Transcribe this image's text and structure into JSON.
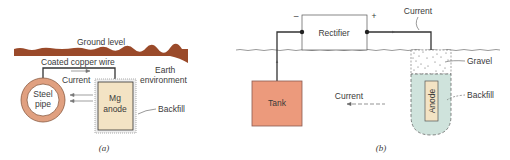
{
  "figure_a": {
    "caption": "(a)",
    "labels": {
      "ground_level": "Ground level",
      "wire": "Coated copper wire",
      "current": "Current",
      "earth_line1": "Earth",
      "earth_line2": "environment",
      "pipe_line1": "Steel",
      "pipe_line2": "pipe",
      "anode_line1": "Mg",
      "anode_line2": "anode",
      "backfill": "Backfill"
    }
  },
  "figure_b": {
    "caption": "(b)",
    "labels": {
      "rectifier": "Rectifier",
      "minus": "–",
      "plus": "+",
      "current_top": "Current",
      "gravel": "Gravel",
      "tank": "Tank",
      "current_ground": "Current",
      "anode": "Anode",
      "backfill": "Backfill"
    }
  },
  "colors": {
    "ground": "#9a4a2a",
    "pipe_ring": "#e0a080",
    "anode_fill": "#f3e3c4",
    "tank_fill": "#ec9a7c",
    "backfill_fill": "#cfe3dc",
    "line": "#333333"
  }
}
